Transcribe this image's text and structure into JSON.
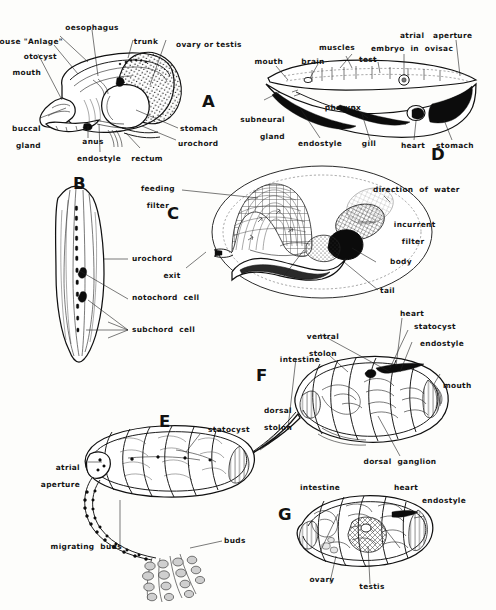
{
  "figure": {
    "panel_count": 7,
    "style": "black-and-white line drawing with leader lines"
  },
  "panels": [
    {
      "id": "A",
      "letter": "A",
      "subject": "Oikopleura / larvacean body plan, lateral view",
      "labels": [
        "house \"Anlage\"",
        "oesophagus",
        "trunk",
        "ovary or testis",
        "otocyst",
        "mouth",
        "buccal\ngland",
        "anus",
        "endostyle",
        "rectum",
        "stomach",
        "urochord"
      ]
    },
    {
      "id": "B",
      "letter": "B",
      "subject": "Tail / notochord detail, longitudinal section",
      "labels": [
        "urochord",
        "notochord cell",
        "subchord cell"
      ]
    },
    {
      "id": "C",
      "letter": "C",
      "subject": "Larvacean inside its mucous house, showing water flow",
      "labels": [
        "feeding\nfilter",
        "exit",
        "direction of water",
        "incurrent\nfilter",
        "body",
        "tail"
      ]
    },
    {
      "id": "D",
      "letter": "D",
      "subject": "Salp / thaliacean longitudinal section",
      "labels": [
        "mouth",
        "brain",
        "muscles",
        "test",
        "embryo in ovisac",
        "atrial aperture",
        "subneural\ngland",
        "pharynx",
        "endostyle",
        "gill",
        "heart",
        "stomach"
      ]
    },
    {
      "id": "E",
      "letter": "E",
      "subject": "Doliolid / salp oozooid with stolon bearing buds",
      "labels": [
        "statocyst",
        "atrial\naperture",
        "migrating buds",
        "buds"
      ]
    },
    {
      "id": "F",
      "letter": "F",
      "subject": "Doliolum oozooid, lateral view",
      "labels": [
        "ventral\nstolon",
        "heart",
        "statocyst",
        "endostyle",
        "intestine",
        "mouth",
        "dorsal\nstolon",
        "dorsal ganglion"
      ]
    },
    {
      "id": "G",
      "letter": "G",
      "subject": "Doliolum gonozooid, lateral view",
      "labels": [
        "intestine",
        "heart",
        "endostyle",
        "ovary",
        "testis"
      ]
    }
  ],
  "colors": {
    "background": "#fdfdfb",
    "ink": "#111111",
    "mid_gray": "#cfcfcf",
    "light_gray": "#f2f2f0"
  },
  "labels": {
    "a_house_anlage": "house \"Anlage\"",
    "a_oesophagus": "oesophagus",
    "a_trunk": "trunk",
    "a_ovary_testis": "ovary or testis",
    "a_otocyst": "otocyst",
    "a_mouth": "mouth",
    "a_buccal_gland_1": "buccal",
    "a_buccal_gland_2": "gland",
    "a_anus": "anus",
    "a_endostyle": "endostyle",
    "a_rectum": "rectum",
    "a_stomach": "stomach",
    "a_urochord": "urochord",
    "b_urochord": "urochord",
    "b_notochord_cell": "notochord  cell",
    "b_subchord_cell": "subchord  cell",
    "c_feeding_1": "feeding",
    "c_feeding_2": "filter",
    "c_exit": "exit",
    "c_direction": "direction  of  water",
    "c_incurrent_1": "incurrent",
    "c_incurrent_2": "filter",
    "c_body": "body",
    "c_tail": "tail",
    "d_mouth": "mouth",
    "d_brain": "brain",
    "d_muscles": "muscles",
    "d_test": "test",
    "d_embryo": "embryo  in  ovisac",
    "d_atrial_aperture": "atrial   aperture",
    "d_subneural_1": "subneural",
    "d_subneural_2": "gland",
    "d_pharynx": "pharynx",
    "d_endostyle": "endostyle",
    "d_gill": "gill",
    "d_heart": "heart",
    "d_stomach": "stomach",
    "e_statocyst": "statocyst",
    "e_atrial_1": "atrial",
    "e_atrial_2": "aperture",
    "e_migrating_buds": "migrating  buds",
    "e_buds": "buds",
    "f_ventral_1": "ventral",
    "f_ventral_2": "stolon",
    "f_heart": "heart",
    "f_statocyst": "statocyst",
    "f_endostyle": "endostyle",
    "f_intestine": "intestine",
    "f_mouth": "mouth",
    "f_dorsal_1": "dorsal",
    "f_dorsal_2": "stolon",
    "f_dorsal_ganglion": "dorsal  ganglion",
    "g_intestine": "intestine",
    "g_heart": "heart",
    "g_endostyle": "endostyle",
    "g_ovary": "ovary",
    "g_testis": "testis"
  },
  "panel_letters": {
    "A": "A",
    "B": "B",
    "C": "C",
    "D": "D",
    "E": "E",
    "F": "F",
    "G": "G"
  }
}
